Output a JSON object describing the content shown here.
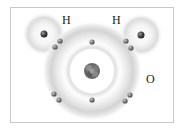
{
  "diagram": {
    "labels": {
      "h_left": "H",
      "h_right": "H",
      "oxygen": "O"
    },
    "atoms": [
      {
        "name": "oxygen",
        "symbol": "O",
        "nucleus": [
          92,
          71
        ],
        "shells": [
          {
            "radius": 22,
            "electrons": 2
          },
          {
            "radius": 38,
            "electrons": 6
          }
        ]
      },
      {
        "name": "hydrogen-left",
        "symbol": "H",
        "nucleus": [
          44,
          34
        ],
        "shells": [
          {
            "radius": 0,
            "electrons": 1
          }
        ]
      },
      {
        "name": "hydrogen-right",
        "symbol": "H",
        "nucleus": [
          141,
          35
        ],
        "shells": [
          {
            "radius": 0,
            "electrons": 1
          }
        ]
      }
    ],
    "colors": {
      "frame_border": "#c8c8c8",
      "halo": "#d9d9d9",
      "electron": "#7d7d7d",
      "nucleus": "#6a6a6a",
      "label": "#222222"
    }
  }
}
